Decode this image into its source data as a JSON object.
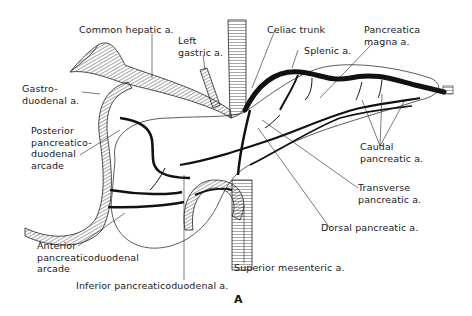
{
  "figure": {
    "panel_label": "A",
    "labels": {
      "common_hepatic": "Common hepatic a.",
      "left_gastric": "Left\ngastric a.",
      "celiac_trunk": "Celiac trunk",
      "pancreatica_magna": "Pancreatica\nmagna a.",
      "splenic": "Splenic a.",
      "gastroduodenal": "Gastro-\nduodenal a.",
      "posterior_arcade": "Posterior\npancreatico-\nduodenal\narcade",
      "caudal_pancreatic": "Caudal\npancreatic a.",
      "transverse_pancreatic": "Transverse\npancreatic a.",
      "dorsal_pancreatic": "Dorsal pancreatic a.",
      "anterior_arcade": "Anterior\npancreaticoduodenal\narcade",
      "superior_mesenteric": "Superior mesenteric a.",
      "inferior_pancreaticoduodenal": "Inferior pancreaticoduodenal a."
    },
    "colors": {
      "ink": "#111111",
      "background": "#ffffff"
    }
  }
}
